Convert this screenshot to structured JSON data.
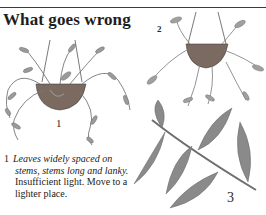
{
  "page": {
    "title": "What goes wrong",
    "figures": [
      {
        "label": "1",
        "subject": "hanging-plant-leggy"
      },
      {
        "label": "2",
        "subject": "hanging-plant-overview"
      },
      {
        "label": "3",
        "subject": "stem-with-leaves-closeup"
      }
    ],
    "captions": [
      {
        "number": "1",
        "symptom_line1": "Leaves widely spaced on",
        "symptom_line2": "stems, stems long and lanky.",
        "remedy_line1": "Insufficient light. Move to a",
        "remedy_line2": "lighter place."
      }
    ]
  },
  "colors": {
    "ink": "#222222",
    "leaf": "#8a8a8a",
    "leaf_dark": "#6e6e6e",
    "pot": "#7a6a60",
    "rule": "#3a3a3a"
  }
}
